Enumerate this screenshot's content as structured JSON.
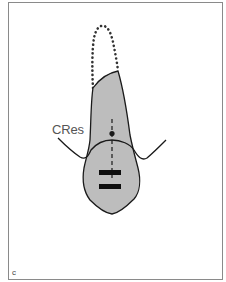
{
  "figure": {
    "panel_label": "c",
    "center_of_resistance_label": "CRes",
    "colors": {
      "tooth_fill": "#bdbdbd",
      "outline": "#1a1a1a",
      "frame": "#8a8a8a",
      "background": "#ffffff",
      "label": "#555555"
    },
    "elements": [
      "tooth-root-outline",
      "crown-dotted-outline",
      "bone-crest-line",
      "center-of-resistance-dot",
      "long-axis-dashed-line",
      "bracket-bar-upper",
      "bracket-bar-lower"
    ]
  }
}
